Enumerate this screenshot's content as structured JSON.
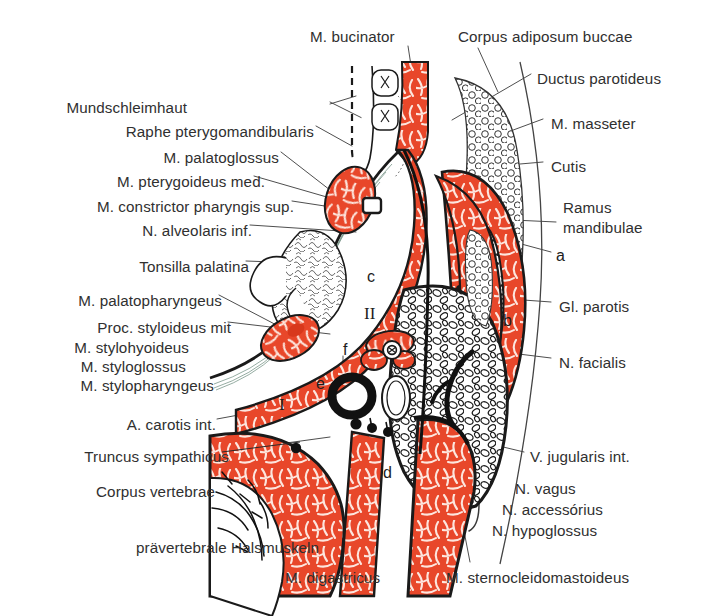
{
  "figure": {
    "type": "anatomical-cross-section",
    "region": "horizontal section through head and neck at level of parotid gland",
    "colors": {
      "muscle_red": "#E8472A",
      "outline_black": "#1a1a1a",
      "label_text": "#303030",
      "background": "#ffffff"
    }
  },
  "labels_left": [
    {
      "id": "mundschleimhaut",
      "text": "Mundschleimhaut",
      "x": 187,
      "y": 106,
      "align": "right"
    },
    {
      "id": "raphe-pterygomandibularis",
      "text": "Raphe pterygomandibularis",
      "x": 88,
      "y": 130,
      "align": "right"
    },
    {
      "id": "m-palatoglossus",
      "text": "M. palatoglossus",
      "x": 166,
      "y": 156,
      "align": "right"
    },
    {
      "id": "m-pterygoideus-med",
      "text": "M. pterygoideus med.",
      "x": 115,
      "y": 180,
      "align": "right"
    },
    {
      "id": "m-constrictor-pharyngis-sup",
      "text": "M. constrictor pharyngis sup.",
      "x": 36,
      "y": 205,
      "align": "right"
    },
    {
      "id": "n-alveolaris-inf",
      "text": "N. alveolaris inf.",
      "x": 117,
      "y": 229,
      "align": "right"
    },
    {
      "id": "tonsilla-palatina",
      "text": "Tonsilla palatina",
      "x": 106,
      "y": 265,
      "align": "right"
    },
    {
      "id": "m-palatopharyngeus",
      "text": "M. palatopharyngeus",
      "x": 41,
      "y": 299,
      "align": "right"
    },
    {
      "id": "proc-styloideus-mit",
      "text": "Proc. styloideus mit",
      "x": 30,
      "y": 326,
      "align": "right"
    },
    {
      "id": "m-stylohyoideus",
      "text": "M. stylohyoideus",
      "x": 30,
      "y": 345,
      "align": "right"
    },
    {
      "id": "m-styloglossus",
      "text": "M. styloglossus",
      "x": 30,
      "y": 364,
      "align": "right"
    },
    {
      "id": "m-stylopharyngeus",
      "text": "M. stylopharyngeus",
      "x": 30,
      "y": 383,
      "align": "right"
    },
    {
      "id": "a-carotis-int",
      "text": "A. carotis int.",
      "x": 101,
      "y": 423,
      "align": "right"
    },
    {
      "id": "truncus-sympathicus",
      "text": "Truncus sympathicus",
      "x": 30,
      "y": 455,
      "align": "right"
    },
    {
      "id": "corpus-vertebrae",
      "text": "Corpus  vertebrae",
      "x": 30,
      "y": 490,
      "align": "right"
    }
  ],
  "labels_top": [
    {
      "id": "m-bucinator",
      "text": "M. bucinator",
      "x": 310,
      "y": 34
    },
    {
      "id": "corpus-adiposum-buccae",
      "text": "Corpus adiposum buccae",
      "x": 458,
      "y": 34
    }
  ],
  "labels_right": [
    {
      "id": "ductus-parotideus",
      "text": "Ductus parotideus",
      "x": 535,
      "y": 77
    },
    {
      "id": "m-masseter",
      "text": "M. masseter",
      "x": 549,
      "y": 122
    },
    {
      "id": "cutis",
      "text": "Cutis",
      "x": 549,
      "y": 165
    },
    {
      "id": "ramus-mandibulae-1",
      "text": "Ramus",
      "x": 561,
      "y": 206
    },
    {
      "id": "ramus-mandibulae-2",
      "text": "mandibulae",
      "x": 561,
      "y": 226
    },
    {
      "id": "gl-parotis",
      "text": "Gl. parotis",
      "x": 557,
      "y": 305
    },
    {
      "id": "n-facialis",
      "text": "N. facialis",
      "x": 557,
      "y": 361
    },
    {
      "id": "v-jugularis-int",
      "text": "V. jugularis int.",
      "x": 528,
      "y": 455
    },
    {
      "id": "n-vagus",
      "text": "N. vagus",
      "x": 513,
      "y": 487
    },
    {
      "id": "n-accessorius",
      "text": "N. accessórius",
      "x": 500,
      "y": 508
    },
    {
      "id": "n-hypoglossus",
      "text": "N. hypoglossus",
      "x": 490,
      "y": 529
    }
  ],
  "labels_bottom": [
    {
      "id": "praevertebrale-halsmuskeln",
      "text": "prävertebrale Halsmuskeln",
      "x": 136,
      "y": 546
    },
    {
      "id": "m-digastricus",
      "text": "M. digastricus",
      "x": 285,
      "y": 576
    },
    {
      "id": "m-sternocleidomastoideus",
      "text": "M. sternocleidomastoideus",
      "x": 446,
      "y": 576
    }
  ],
  "markers": [
    {
      "id": "marker-a",
      "text": "a",
      "x": 556,
      "y": 255
    },
    {
      "id": "marker-b",
      "text": "b",
      "x": 503,
      "y": 320
    },
    {
      "id": "marker-c",
      "text": "c",
      "x": 367,
      "y": 276
    },
    {
      "id": "marker-d",
      "text": "d",
      "x": 383,
      "y": 472
    },
    {
      "id": "marker-e",
      "text": "e",
      "x": 316,
      "y": 383
    },
    {
      "id": "marker-f",
      "text": "f",
      "x": 343,
      "y": 349
    },
    {
      "id": "marker-I",
      "text": "I",
      "x": 279,
      "y": 403
    },
    {
      "id": "marker-II",
      "text": "II",
      "x": 364,
      "y": 312
    }
  ]
}
